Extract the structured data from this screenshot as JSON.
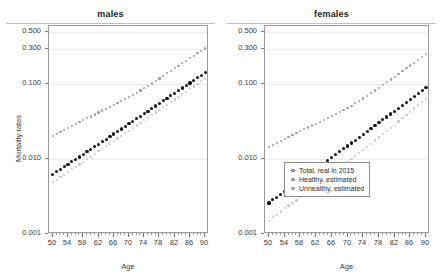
{
  "figure": {
    "xlabel": "Age",
    "ylabel": "Mortality rates"
  },
  "panels": [
    {
      "title": "males"
    },
    {
      "title": "females"
    }
  ],
  "axes": {
    "y_ticks": [
      "0.001",
      "0.010",
      "0.100",
      "0.300",
      "0.500"
    ],
    "y_tick_values": [
      0.001,
      0.01,
      0.1,
      0.3,
      0.5
    ],
    "x_ticks": [
      "50",
      "54",
      "58",
      "62",
      "66",
      "70",
      "74",
      "78",
      "82",
      "86",
      "90"
    ],
    "x_tick_values": [
      50,
      54,
      58,
      62,
      66,
      70,
      74,
      78,
      82,
      86,
      90
    ],
    "x_minor_step": 1,
    "scale": "log"
  },
  "legend": {
    "position": "bottom-right of females panel",
    "entries": [
      {
        "label": "Total, real in 2015",
        "marker": "open-circle",
        "color": "#202020"
      },
      {
        "label": "Healthy, estimated",
        "marker": "dot",
        "color": "#8f8f8f"
      },
      {
        "label": "Unhealthy, estimated",
        "marker": "dot",
        "color": "#8f8f8f"
      }
    ]
  },
  "colors": {
    "total": "#151515",
    "unhealthy": "#9e9e9e",
    "healthy": "#c9c9c9",
    "axis": "#9a9a9a",
    "grid": "#ececec"
  },
  "chart_data": {
    "type": "scatter",
    "xlabel": "Age",
    "ylabel": "Mortality rates",
    "xlim": [
      49,
      91
    ],
    "ylim": [
      0.001,
      0.6
    ],
    "yscale": "log",
    "grid": true,
    "legend_position": "lower right (females panel)",
    "x": [
      50,
      51,
      52,
      53,
      54,
      55,
      56,
      57,
      58,
      59,
      60,
      61,
      62,
      63,
      64,
      65,
      66,
      67,
      68,
      69,
      70,
      71,
      72,
      73,
      74,
      75,
      76,
      77,
      78,
      79,
      80,
      81,
      82,
      83,
      84,
      85,
      86,
      87,
      88,
      89,
      90
    ],
    "panels": [
      {
        "title": "males",
        "series": [
          {
            "name": "Total, real in 2015",
            "marker": "filled-circle",
            "color": "#151515",
            "values": [
              0.0063,
              0.0068,
              0.0073,
              0.0079,
              0.0085,
              0.0092,
              0.0099,
              0.0107,
              0.0116,
              0.0125,
              0.0135,
              0.0146,
              0.0158,
              0.0171,
              0.0185,
              0.02,
              0.0216,
              0.0234,
              0.0253,
              0.0274,
              0.0296,
              0.032,
              0.0346,
              0.0374,
              0.0405,
              0.0438,
              0.0474,
              0.0513,
              0.0555,
              0.06,
              0.0649,
              0.0702,
              0.076,
              0.0822,
              0.0889,
              0.0962,
              0.1041,
              0.1126,
              0.1218,
              0.1318,
              0.1426
            ]
          },
          {
            "name": "Unhealthy, estimated",
            "marker": "dot",
            "color": "#9e9e9e",
            "values": [
              0.0206,
              0.0219,
              0.0232,
              0.0246,
              0.0261,
              0.0277,
              0.0294,
              0.0312,
              0.0331,
              0.0351,
              0.0372,
              0.0395,
              0.0419,
              0.0445,
              0.0472,
              0.0501,
              0.0532,
              0.0565,
              0.06,
              0.0637,
              0.0677,
              0.0721,
              0.077,
              0.0824,
              0.0884,
              0.0951,
              0.1025,
              0.1106,
              0.1195,
              0.1292,
              0.1398,
              0.1512,
              0.1635,
              0.1768,
              0.1911,
              0.2064,
              0.2228,
              0.2402,
              0.2588,
              0.2785,
              0.2995
            ]
          },
          {
            "name": "Healthy, estimated",
            "marker": "dot",
            "color": "#c9c9c9",
            "values": [
              0.0049,
              0.0053,
              0.0057,
              0.0062,
              0.0067,
              0.0073,
              0.0079,
              0.0085,
              0.0092,
              0.01,
              0.0108,
              0.0117,
              0.0127,
              0.0137,
              0.0149,
              0.0161,
              0.0175,
              0.0189,
              0.0205,
              0.0222,
              0.024,
              0.026,
              0.0282,
              0.0305,
              0.0331,
              0.0358,
              0.0388,
              0.042,
              0.0455,
              0.0493,
              0.0534,
              0.0578,
              0.0626,
              0.0678,
              0.0734,
              0.0795,
              0.0861,
              0.0932,
              0.1009,
              0.1093,
              0.1183
            ]
          }
        ]
      },
      {
        "title": "females",
        "series": [
          {
            "name": "Total, real in 2015",
            "marker": "filled-circle",
            "color": "#151515",
            "values": [
              0.0026,
              0.0029,
              0.0031,
              0.0034,
              0.0037,
              0.004,
              0.0044,
              0.0048,
              0.0052,
              0.0057,
              0.0062,
              0.0068,
              0.0074,
              0.0081,
              0.0088,
              0.0096,
              0.0105,
              0.0115,
              0.0126,
              0.0137,
              0.015,
              0.0164,
              0.0179,
              0.0196,
              0.0214,
              0.0234,
              0.0256,
              0.028,
              0.0306,
              0.0335,
              0.0366,
              0.04,
              0.0438,
              0.0479,
              0.0524,
              0.0573,
              0.0627,
              0.0686,
              0.075,
              0.0821,
              0.0898
            ]
          },
          {
            "name": "Unhealthy, estimated",
            "marker": "dot",
            "color": "#9e9e9e",
            "values": [
              0.0147,
              0.0156,
              0.0165,
              0.0175,
              0.0186,
              0.0197,
              0.0209,
              0.0222,
              0.0235,
              0.025,
              0.0265,
              0.0281,
              0.0298,
              0.0317,
              0.0336,
              0.0357,
              0.0379,
              0.0403,
              0.0428,
              0.0455,
              0.0484,
              0.0518,
              0.0556,
              0.0599,
              0.0647,
              0.07,
              0.0759,
              0.0824,
              0.0896,
              0.0975,
              0.1062,
              0.1157,
              0.1261,
              0.1374,
              0.1498,
              0.1633,
              0.178,
              0.194,
              0.2114,
              0.2303,
              0.2508
            ]
          },
          {
            "name": "Healthy, estimated",
            "marker": "dot",
            "color": "#c9c9c9",
            "values": [
              0.0015,
              0.0017,
              0.0018,
              0.002,
              0.0022,
              0.0024,
              0.0026,
              0.0028,
              0.0031,
              0.0034,
              0.0037,
              0.004,
              0.0044,
              0.0048,
              0.0053,
              0.0058,
              0.0063,
              0.0069,
              0.0076,
              0.0083,
              0.0091,
              0.01,
              0.011,
              0.0121,
              0.0133,
              0.0146,
              0.0161,
              0.0177,
              0.0195,
              0.0215,
              0.0237,
              0.0261,
              0.0288,
              0.0318,
              0.0351,
              0.0388,
              0.0429,
              0.0474,
              0.0524,
              0.058,
              0.0642
            ]
          }
        ]
      }
    ]
  }
}
